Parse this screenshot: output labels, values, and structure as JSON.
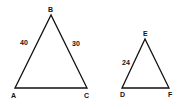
{
  "triangles": [
    {
      "name": "ABC",
      "vertices": {
        "A": "A",
        "B": "B",
        "C": "C"
      },
      "side_labels": {
        "AB": "40",
        "BC": "30"
      }
    },
    {
      "name": "DEF",
      "vertices": {
        "D": "D",
        "E": "E",
        "F": "F"
      },
      "side_labels": {
        "DE": "24"
      }
    }
  ],
  "colors": {
    "stroke": "#111111",
    "background": "#ffffff"
  }
}
